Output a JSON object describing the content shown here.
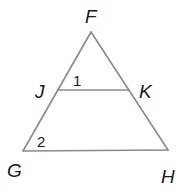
{
  "figure": {
    "type": "triangle with midsegment",
    "vertices": {
      "F": "F",
      "G": "G",
      "H": "H",
      "J": "J",
      "K": "K"
    },
    "angle_labels": {
      "angle1": "1",
      "angle2": "2"
    },
    "segments": [
      "FG",
      "FH",
      "GH",
      "JK"
    ],
    "stroke_color": "#8a8a8a",
    "text_color": "#1a1a1a"
  }
}
